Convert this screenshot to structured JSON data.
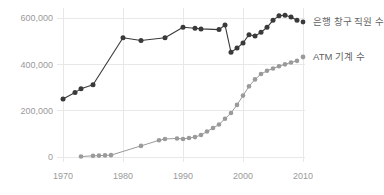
{
  "chart_data": {
    "type": "line",
    "title": "",
    "subtitle": "",
    "xlabel": "",
    "ylabel": "",
    "xlim": [
      1970,
      2010
    ],
    "ylim": [
      0,
      600000
    ],
    "grid": true,
    "legend_position": "right",
    "x_ticks": [
      "1970",
      "1980",
      "1990",
      "2000",
      "2010"
    ],
    "x_tick_values": [
      1970,
      1980,
      1990,
      2000,
      2010
    ],
    "y_ticks": [
      "0",
      "200,000",
      "400,000",
      "600,000"
    ],
    "y_tick_values": [
      0,
      200000,
      400000,
      600000
    ],
    "series": [
      {
        "name": "은행 창구 직원 수",
        "color": "#3a3a3a",
        "x": [
          1970,
          1972,
          1973,
          1975,
          1980,
          1983,
          1987,
          1990,
          1992,
          1993,
          1996,
          1997,
          1998,
          1999,
          2000,
          2001,
          2002,
          2003,
          2004,
          2005,
          2006,
          2007,
          2008,
          2009
        ],
        "values": [
          250000,
          278000,
          295000,
          312000,
          515000,
          503000,
          515000,
          560000,
          556000,
          553000,
          550000,
          570000,
          452000,
          470000,
          492000,
          528000,
          522000,
          538000,
          560000,
          590000,
          610000,
          612000,
          604000,
          590000
        ]
      },
      {
        "name": "ATM 기계 수",
        "color": "#9a9a9a",
        "x": [
          1973,
          1975,
          1976,
          1977,
          1978,
          1983,
          1986,
          1987,
          1989,
          1990,
          1991,
          1992,
          1993,
          1994,
          1995,
          1996,
          1997,
          1998,
          1999,
          2000,
          2001,
          2002,
          2003,
          2004,
          2005,
          2006,
          2007,
          2008,
          2009
        ],
        "values": [
          2000,
          5000,
          6000,
          7000,
          8000,
          48000,
          72000,
          78000,
          80000,
          78000,
          82000,
          86000,
          95000,
          110000,
          125000,
          140000,
          165000,
          190000,
          225000,
          265000,
          305000,
          335000,
          358000,
          372000,
          382000,
          392000,
          400000,
          408000,
          415000
        ]
      }
    ]
  },
  "legend": {
    "items": [
      {
        "label": "은행 창구 직원 수",
        "color": "#3a3a3a"
      },
      {
        "label": "ATM 기계 수",
        "color": "#9a9a9a"
      }
    ]
  }
}
